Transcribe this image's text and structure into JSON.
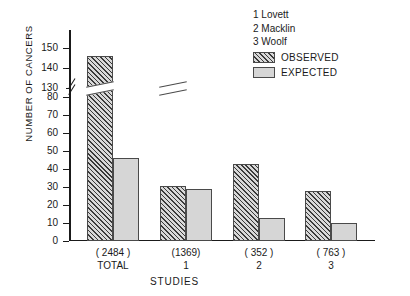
{
  "chart_data": {
    "type": "bar",
    "title": "",
    "xlabel": "STUDIES",
    "ylabel": "NUMBER OF CANCERS",
    "categories": [
      "TOTAL",
      "1",
      "2",
      "3"
    ],
    "category_counts": [
      "( 2484 )",
      "(1369)",
      "( 352 )",
      "( 763 )"
    ],
    "series": [
      {
        "name": "OBSERVED",
        "values": [
          146,
          81,
          43,
          28
        ]
      },
      {
        "name": "EXPECTED",
        "values": [
          46,
          29,
          13,
          10
        ]
      }
    ],
    "ylim": [
      0,
      150
    ],
    "ytick_labels": [
      "0",
      "10",
      "20",
      "30",
      "40",
      "50",
      "60",
      "70",
      "80",
      "130",
      "140",
      "150"
    ],
    "axis_break": {
      "from": 80,
      "to": 130,
      "present": true
    },
    "grid": false,
    "legend_position": "top-right",
    "annotations": [
      "1 Lovett",
      "2 Macklin",
      "3 Woolf"
    ]
  },
  "legend": {
    "notes": [
      "1 Lovett",
      "2 Macklin",
      "3 Woolf"
    ],
    "keys": [
      {
        "label": "OBSERVED",
        "pattern": "hatched"
      },
      {
        "label": "EXPECTED",
        "pattern": "solid-gray"
      }
    ]
  },
  "colors": {
    "observed_hatch": "#3a3a3a",
    "expected_fill": "#d6d6d6",
    "axis": "#1a1a1a",
    "background": "#ffffff"
  }
}
